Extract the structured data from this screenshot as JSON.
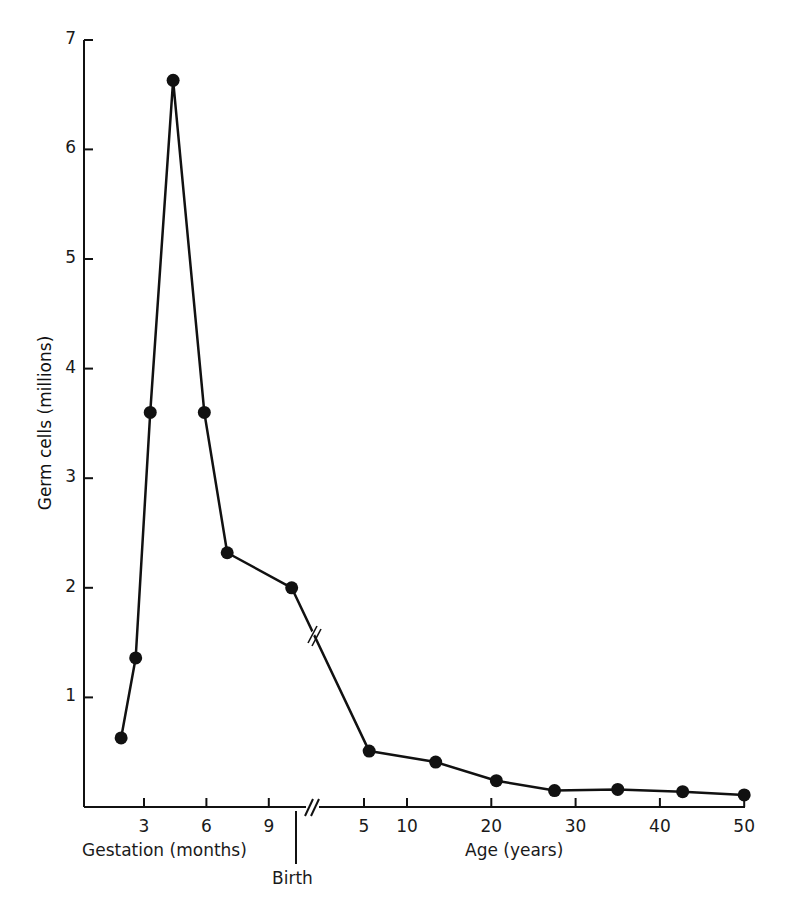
{
  "chart_data": {
    "type": "line",
    "title": "",
    "ylabel": "Germ cells (millions)",
    "ylim": [
      0,
      7
    ],
    "yticks": [
      1,
      2,
      3,
      4,
      5,
      6,
      7
    ],
    "grid": false,
    "legend": null,
    "x_segments": [
      {
        "name": "Gestation (months)",
        "ticks": [
          3,
          6,
          9
        ]
      },
      {
        "name": "Age (years)",
        "ticks": [
          5,
          10,
          20,
          30,
          40,
          50
        ]
      }
    ],
    "annotations": [
      "Birth",
      "axis break //"
    ],
    "series": [
      {
        "name": "Germ cells",
        "points": [
          {
            "segment": "gestation",
            "x": 1.9,
            "y": 0.63
          },
          {
            "segment": "gestation",
            "x": 2.6,
            "y": 1.36
          },
          {
            "segment": "gestation",
            "x": 3.3,
            "y": 3.6
          },
          {
            "segment": "gestation",
            "x": 4.4,
            "y": 6.63
          },
          {
            "segment": "gestation",
            "x": 5.9,
            "y": 3.6
          },
          {
            "segment": "gestation",
            "x": 7.0,
            "y": 2.32
          },
          {
            "segment": "gestation",
            "x": 10.1,
            "y": 2.0
          },
          {
            "segment": "age",
            "x": 5.6,
            "y": 0.51
          },
          {
            "segment": "age",
            "x": 13.4,
            "y": 0.41
          },
          {
            "segment": "age",
            "x": 20.6,
            "y": 0.24
          },
          {
            "segment": "age",
            "x": 27.5,
            "y": 0.15
          },
          {
            "segment": "age",
            "x": 35,
            "y": 0.16
          },
          {
            "segment": "age",
            "x": 42.7,
            "y": 0.14
          },
          {
            "segment": "age",
            "x": 50,
            "y": 0.11
          }
        ]
      }
    ]
  },
  "labels": {
    "ylabel": "Germ cells (millions)",
    "gestation": "Gestation (months)",
    "age": "Age (years)",
    "birth": "Birth",
    "yticks": [
      "1",
      "2",
      "3",
      "4",
      "5",
      "6",
      "7"
    ],
    "gest_ticks": [
      "3",
      "6",
      "9"
    ],
    "age_ticks": [
      "5",
      "10",
      "20",
      "30",
      "40",
      "50"
    ]
  },
  "style": {
    "ink": "#111111",
    "background": "#ffffff"
  }
}
